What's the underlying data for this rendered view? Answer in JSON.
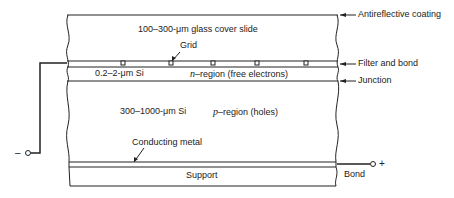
{
  "diagram": {
    "type": "solar-cell-cross-section",
    "layers": {
      "cover": {
        "thickness": "100–300-",
        "unit": "μm",
        "material": " glass cover slide"
      },
      "n_layer": {
        "thickness": "0.2–2-",
        "unit": "μm",
        "material": " Si"
      },
      "n_region": {
        "symbol": "n",
        "text": "–region (free electrons)"
      },
      "p_layer": {
        "thickness": "300–1000-",
        "unit": "μm",
        "material": " Si"
      },
      "p_region": {
        "symbol": "p",
        "text": "–region (holes)"
      },
      "support": "Support"
    },
    "callouts": {
      "grid": "Grid",
      "conducting_metal": "Conducting metal",
      "antireflective": "Antireflective coating",
      "filter_bond": "Filter and bond",
      "junction": "Junction",
      "bond": "Bond"
    },
    "terminals": {
      "negative": "–",
      "positive": "+"
    }
  }
}
